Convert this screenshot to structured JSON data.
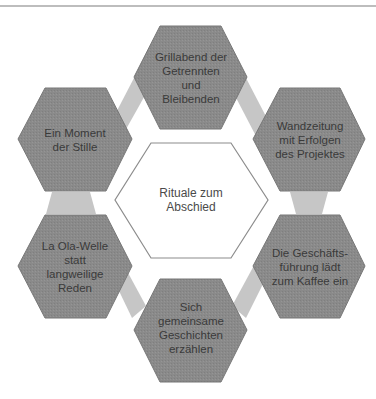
{
  "diagram": {
    "center": {
      "label": "Rituale zum\nAbschied"
    },
    "nodes": [
      {
        "id": "top",
        "label": "Grillabend der\nGetrennten\nund\nBleibenden"
      },
      {
        "id": "upper-right",
        "label": "Wandzeitung\nmit Erfolgen\ndes Projektes"
      },
      {
        "id": "lower-right",
        "label": "Die Geschäfts-\nführung lädt\nzum Kaffee ein"
      },
      {
        "id": "bottom",
        "label": "Sich\ngemeinsame\nGeschichten\nerzählen"
      },
      {
        "id": "lower-left",
        "label": "La Ola-Welle\nstatt\nlangweilige\nReden"
      },
      {
        "id": "upper-left",
        "label": "Ein Moment\nder Stille"
      }
    ],
    "colors": {
      "node_fill": "#8a8a8a",
      "node_stroke": "#6f6f6f",
      "connector_fill": "#c4c4c4",
      "center_fill": "#ffffff",
      "center_stroke": "#8a8a8a",
      "text": "#3a3a3a"
    }
  }
}
